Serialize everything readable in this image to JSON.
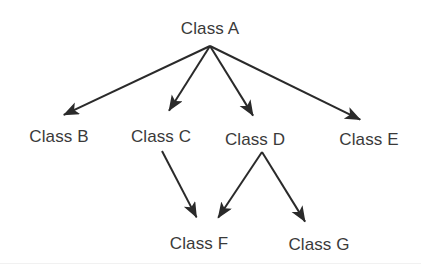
{
  "diagram": {
    "type": "class-hierarchy-tree",
    "background_color": "#ffffff",
    "line_color": "#2a2a2a",
    "text_color": "#3a3a3a",
    "nodes": [
      {
        "id": "A",
        "label": "Class A",
        "x": 210,
        "y": 28
      },
      {
        "id": "B",
        "label": "Class B",
        "x": 59,
        "y": 136
      },
      {
        "id": "C",
        "label": "Class C",
        "x": 161,
        "y": 136
      },
      {
        "id": "D",
        "label": "Class D",
        "x": 255,
        "y": 139
      },
      {
        "id": "E",
        "label": "Class E",
        "x": 369,
        "y": 139
      },
      {
        "id": "F",
        "label": "Class F",
        "x": 199,
        "y": 243
      },
      {
        "id": "G",
        "label": "Class G",
        "x": 319,
        "y": 244
      }
    ],
    "edges": [
      {
        "from": "A",
        "to": "B",
        "x1": 210,
        "y1": 46,
        "x2": 57,
        "y2": 118,
        "arrow": "end"
      },
      {
        "from": "A",
        "to": "C",
        "x1": 210,
        "y1": 46,
        "x2": 165,
        "y2": 117,
        "arrow": "end"
      },
      {
        "from": "A",
        "to": "D",
        "x1": 210,
        "y1": 46,
        "x2": 257,
        "y2": 122,
        "arrow": "end"
      },
      {
        "from": "A",
        "to": "E",
        "x1": 210,
        "y1": 46,
        "x2": 367,
        "y2": 123,
        "arrow": "end"
      },
      {
        "from": "C",
        "to": "F",
        "x1": 162,
        "y1": 151,
        "x2": 200,
        "y2": 224,
        "arrow": "end"
      },
      {
        "from": "D",
        "to": "F",
        "x1": 262,
        "y1": 152,
        "x2": 214,
        "y2": 224,
        "arrow": "end"
      },
      {
        "from": "D",
        "to": "G",
        "x1": 262,
        "y1": 152,
        "x2": 309,
        "y2": 228,
        "arrow": "end"
      }
    ]
  }
}
